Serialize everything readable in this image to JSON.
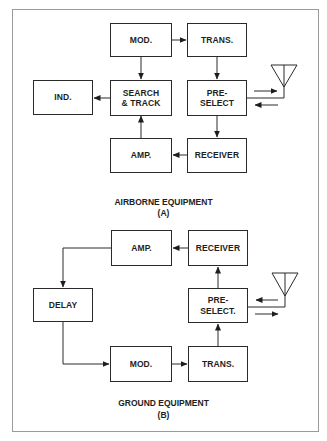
{
  "diagram": {
    "airborne": {
      "title": "AIRBORNE EQUIPMENT",
      "label": "(A)",
      "blocks": {
        "mod": "MOD.",
        "trans": "TRANS.",
        "ind": "IND.",
        "search_track": "SEARCH\n& TRACK",
        "preselect": "PRE-\nSELECT",
        "amp": "AMP.",
        "receiver": "RECEIVER"
      },
      "connections": [
        {
          "from": "MOD.",
          "to": "TRANS."
        },
        {
          "from": "MOD.",
          "to": "SEARCH & TRACK"
        },
        {
          "from": "TRANS.",
          "to": "PRE-SELECT"
        },
        {
          "from": "SEARCH & TRACK",
          "to": "IND."
        },
        {
          "from": "PRE-SELECT",
          "to": "RECEIVER"
        },
        {
          "from": "RECEIVER",
          "to": "AMP."
        },
        {
          "from": "AMP.",
          "to": "SEARCH & TRACK"
        },
        {
          "from": "PRE-SELECT",
          "to": "antenna",
          "bidirectional": true
        }
      ]
    },
    "ground": {
      "title": "GROUND EQUIPMENT",
      "label": "(B)",
      "blocks": {
        "amp": "AMP.",
        "receiver": "RECEIVER",
        "delay": "DELAY",
        "preselect": "PRE-\nSELECT.",
        "mod": "MOD.",
        "trans": "TRANS."
      },
      "connections": [
        {
          "from": "RECEIVER",
          "to": "AMP."
        },
        {
          "from": "AMP.",
          "to": "DELAY"
        },
        {
          "from": "DELAY",
          "to": "MOD."
        },
        {
          "from": "MOD.",
          "to": "TRANS."
        },
        {
          "from": "TRANS.",
          "to": "PRE-SELECT."
        },
        {
          "from": "PRE-SELECT.",
          "to": "RECEIVER"
        },
        {
          "from": "PRE-SELECT.",
          "to": "antenna",
          "bidirectional": true
        }
      ]
    }
  }
}
